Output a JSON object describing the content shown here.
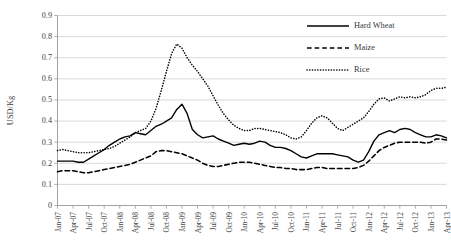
{
  "chart_data": {
    "type": "line",
    "title": "",
    "xlabel": "",
    "ylabel": "USD/Kg",
    "ylim": [
      0,
      0.9
    ],
    "ytick_step": 0.1,
    "ytick_labels": [
      "0",
      "0.1",
      "0.2",
      "0.3",
      "0.4",
      "0.5",
      "0.6",
      "0.7",
      "0.8",
      "0.9"
    ],
    "grid": "horizontal",
    "legend_position": "top-right",
    "x_tick_labels": [
      "Jan-07",
      "Apr-07",
      "Jul-07",
      "Oct-07",
      "Jan-08",
      "Apr-08",
      "Jul-08",
      "Oct-08",
      "Jan-09",
      "Apr-09",
      "Jul-09",
      "Oct-09",
      "Jan-10",
      "Apr-10",
      "Jul-10",
      "Oct-10",
      "Jan-11",
      "Apr-11",
      "Jul-11",
      "Oct-11",
      "Jan-12",
      "Apr-12",
      "Jul-12",
      "Oct-12",
      "Jan-13",
      "Apr-13"
    ],
    "x_tick_interval_months": 3,
    "x_start": "Jan-07",
    "x_end": "Apr-13",
    "n_points": 76,
    "series": [
      {
        "name": "Hard Wheat",
        "style": "solid",
        "color": "#000000",
        "values": [
          0.21,
          0.21,
          0.21,
          0.21,
          0.205,
          0.205,
          0.22,
          0.235,
          0.25,
          0.265,
          0.285,
          0.3,
          0.315,
          0.325,
          0.33,
          0.345,
          0.34,
          0.335,
          0.355,
          0.375,
          0.385,
          0.4,
          0.415,
          0.455,
          0.48,
          0.435,
          0.36,
          0.335,
          0.32,
          0.325,
          0.33,
          0.315,
          0.305,
          0.295,
          0.285,
          0.29,
          0.295,
          0.29,
          0.295,
          0.305,
          0.3,
          0.285,
          0.275,
          0.275,
          0.27,
          0.26,
          0.245,
          0.23,
          0.225,
          0.235,
          0.245,
          0.245,
          0.245,
          0.245,
          0.24,
          0.235,
          0.23,
          0.215,
          0.205,
          0.215,
          0.255,
          0.305,
          0.335,
          0.345,
          0.355,
          0.345,
          0.36,
          0.365,
          0.36,
          0.345,
          0.335,
          0.325,
          0.325,
          0.335,
          0.33,
          0.32
        ]
      },
      {
        "name": "Maize",
        "style": "dashed",
        "color": "#000000",
        "values": [
          0.16,
          0.165,
          0.165,
          0.165,
          0.16,
          0.155,
          0.155,
          0.16,
          0.165,
          0.17,
          0.175,
          0.18,
          0.185,
          0.19,
          0.195,
          0.205,
          0.215,
          0.225,
          0.235,
          0.255,
          0.26,
          0.26,
          0.255,
          0.25,
          0.245,
          0.235,
          0.225,
          0.215,
          0.2,
          0.19,
          0.185,
          0.185,
          0.19,
          0.195,
          0.2,
          0.205,
          0.205,
          0.205,
          0.2,
          0.195,
          0.19,
          0.185,
          0.18,
          0.18,
          0.175,
          0.175,
          0.17,
          0.17,
          0.17,
          0.175,
          0.18,
          0.18,
          0.175,
          0.175,
          0.175,
          0.175,
          0.175,
          0.175,
          0.18,
          0.19,
          0.21,
          0.235,
          0.26,
          0.275,
          0.285,
          0.295,
          0.3,
          0.3,
          0.3,
          0.3,
          0.3,
          0.295,
          0.3,
          0.315,
          0.315,
          0.31
        ]
      },
      {
        "name": "Rice",
        "style": "dotted",
        "color": "#000000",
        "values": [
          0.26,
          0.265,
          0.26,
          0.255,
          0.25,
          0.25,
          0.25,
          0.255,
          0.26,
          0.265,
          0.27,
          0.28,
          0.295,
          0.31,
          0.325,
          0.345,
          0.355,
          0.365,
          0.4,
          0.46,
          0.545,
          0.635,
          0.72,
          0.765,
          0.745,
          0.7,
          0.665,
          0.635,
          0.6,
          0.565,
          0.52,
          0.475,
          0.435,
          0.405,
          0.38,
          0.365,
          0.355,
          0.355,
          0.365,
          0.365,
          0.36,
          0.355,
          0.35,
          0.345,
          0.335,
          0.32,
          0.315,
          0.325,
          0.355,
          0.39,
          0.415,
          0.425,
          0.415,
          0.39,
          0.365,
          0.355,
          0.37,
          0.385,
          0.4,
          0.415,
          0.445,
          0.48,
          0.505,
          0.51,
          0.495,
          0.505,
          0.515,
          0.51,
          0.515,
          0.51,
          0.515,
          0.525,
          0.545,
          0.555,
          0.555,
          0.56
        ]
      }
    ]
  },
  "legend": {
    "items": [
      {
        "label": "Hard Wheat",
        "style": "solid"
      },
      {
        "label": "Maize",
        "style": "dashed"
      },
      {
        "label": "Rice",
        "style": "dotted"
      }
    ]
  }
}
